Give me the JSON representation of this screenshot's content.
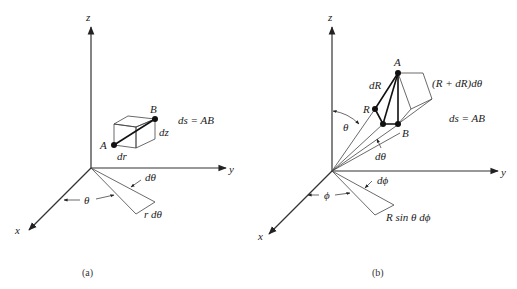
{
  "figure": {
    "panel_a": {
      "caption": "(a)",
      "axes": {
        "z": "z",
        "y": "y",
        "x": "x"
      },
      "points": {
        "A": "A",
        "B": "B"
      },
      "labels": {
        "ds": "ds = AB",
        "dz": "dz",
        "dr": "dr",
        "dtheta": "dθ",
        "theta": "θ",
        "r_dtheta": "r dθ"
      }
    },
    "panel_b": {
      "caption": "(b)",
      "axes": {
        "z": "z",
        "y": "y",
        "x": "x"
      },
      "points": {
        "A": "A",
        "B": "B",
        "R": "R"
      },
      "labels": {
        "dR": "dR",
        "R_dR_dtheta": "(R + dR)dθ",
        "ds": "ds = AB",
        "theta": "θ",
        "dtheta": "dθ",
        "dphi": "dϕ",
        "phi": "ϕ",
        "R_sin": "R sin θ dϕ"
      }
    }
  }
}
